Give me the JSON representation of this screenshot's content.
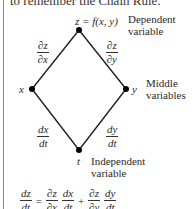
{
  "top_text": "to remember the Chain Rule.",
  "nodes": {
    "top": {
      "label": "z = f(x, y)",
      "annotation": [
        "Dependent",
        "variable"
      ]
    },
    "left": {
      "label": "x"
    },
    "right": {
      "label": "y",
      "annotation": [
        "Middle",
        "variables"
      ]
    },
    "bottom": {
      "label": "t",
      "annotation": [
        "Independent",
        "variable"
      ]
    }
  },
  "edges": {
    "top_left": {
      "num": "∂z",
      "den": "∂x"
    },
    "top_right": {
      "num": "∂z",
      "den": "∂y"
    },
    "left_bottom": {
      "num": "dx",
      "den": "dt"
    },
    "right_bottom": {
      "num": "dy",
      "den": "dt"
    }
  },
  "formula": {
    "lhs": {
      "num": "dz",
      "den": "dt"
    },
    "eq": "=",
    "t1a": {
      "num": "∂z",
      "den": "∂x"
    },
    "t1b": {
      "num": "dx",
      "den": "dt"
    },
    "plus": "+",
    "t2a": {
      "num": "∂z",
      "den": "∂y"
    },
    "t2b": {
      "num": "dy",
      "den": "dt"
    }
  },
  "colors": {
    "line": "#1a1a1a",
    "node": "#000000",
    "border": "#8a8a8a"
  }
}
